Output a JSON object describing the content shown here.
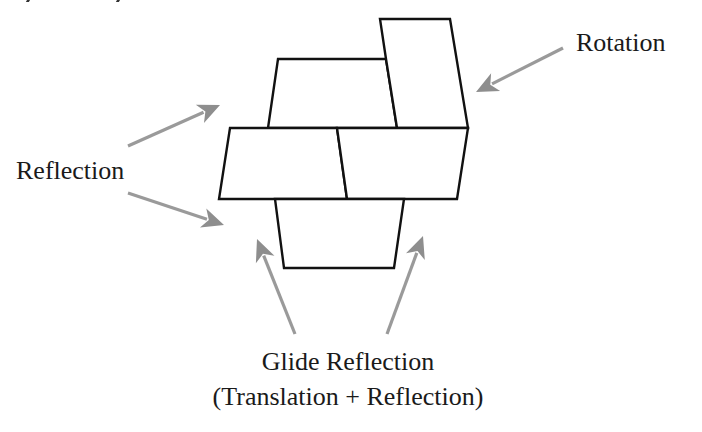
{
  "diagram": {
    "labels": {
      "reflection": "Reflection",
      "rotation": "Rotation",
      "glide_reflection": "Glide Reflection",
      "glide_reflection_sub": "(Translation + Reflection)"
    },
    "colors": {
      "outline": "#111111",
      "arrow": "#9a9a9a",
      "background": "#ffffff"
    },
    "shapes": [
      {
        "id": "top-trapezoid",
        "points": "278,59 386,59 397,128 268,128"
      },
      {
        "id": "rotated-piece",
        "points": "380,19 450,19 468,128 397,128 386,59"
      },
      {
        "id": "middle-left",
        "points": "230,128 337,128 347,199 219,199"
      },
      {
        "id": "middle-right",
        "points": "337,128 468,128 457,199 347,199"
      },
      {
        "id": "bottom-trapezoid",
        "points": "275,199 404,199 394,268 284,268"
      }
    ],
    "arrows": [
      {
        "id": "reflection-upper",
        "from": [
          128,
          146
        ],
        "to": [
          220,
          105
        ]
      },
      {
        "id": "reflection-lower",
        "from": [
          128,
          193
        ],
        "to": [
          224,
          225
        ]
      },
      {
        "id": "rotation",
        "from": [
          563,
          48
        ],
        "to": [
          476,
          92
        ]
      },
      {
        "id": "glide-left",
        "from": [
          295,
          334
        ],
        "to": [
          257,
          239
        ]
      },
      {
        "id": "glide-right",
        "from": [
          387,
          334
        ],
        "to": [
          423,
          236
        ]
      }
    ]
  }
}
